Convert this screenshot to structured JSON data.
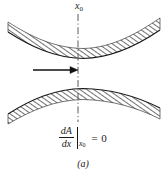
{
  "figure": {
    "caption": "(a)",
    "axis_label": {
      "base": "x",
      "subscript": "0",
      "full": "x0"
    },
    "equation": {
      "numerator": "dA",
      "denominator": "dx",
      "evaluated_at_base": "x",
      "evaluated_at_subscript": "0",
      "equals": "=",
      "value": "0",
      "full": "dA/dx |x0 = 0"
    },
    "elements": {
      "upper_band_name": "upper-hatched-band",
      "lower_band_name": "lower-hatched-band",
      "centerline_name": "dash-dot-centerline",
      "arrow_name": "flow-direction-arrow"
    },
    "colors": {
      "ink": "#1a1a1a",
      "hatch": "#2b2b2b",
      "background": "#ffffff",
      "centerline": "#5a5a5a"
    },
    "geometry": {
      "width": 166,
      "height": 179,
      "centerline_x": 78,
      "centerline_y_top": 14,
      "centerline_y_bottom": 122,
      "arrow_y": 70,
      "arrow_x_start": 33,
      "arrow_x_end": 78,
      "hatch_angle_deg": 55
    }
  }
}
